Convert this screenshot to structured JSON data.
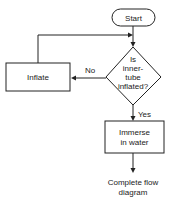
{
  "diagram": {
    "type": "flowchart",
    "nodes": [
      {
        "id": "start",
        "shape": "terminal",
        "lines": [
          "Start"
        ]
      },
      {
        "id": "decision",
        "shape": "decision",
        "lines": [
          "Is",
          "inner-",
          "tube",
          "inflated?"
        ]
      },
      {
        "id": "inflate",
        "shape": "process",
        "lines": [
          "Inflate"
        ]
      },
      {
        "id": "immerse",
        "shape": "process",
        "lines": [
          "Immerse",
          "in water"
        ]
      },
      {
        "id": "end",
        "shape": "text",
        "lines": [
          "Complete flow",
          "diagram"
        ]
      }
    ],
    "edges": [
      {
        "from": "start",
        "to": "decision",
        "label": ""
      },
      {
        "from": "decision",
        "to": "inflate",
        "label": "No"
      },
      {
        "from": "inflate",
        "to": "decision",
        "label": ""
      },
      {
        "from": "decision",
        "to": "immerse",
        "label": "Yes"
      },
      {
        "from": "immerse",
        "to": "end",
        "label": ""
      }
    ]
  }
}
